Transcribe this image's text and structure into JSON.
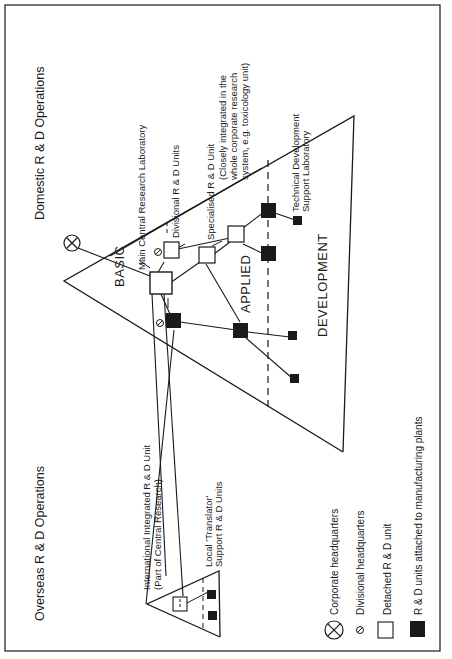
{
  "diagram": {
    "titles": {
      "domestic": "Domestic R & D Operations",
      "overseas": "Overseas R & D Operations"
    },
    "zones": {
      "basic": "BASIC",
      "applied": "APPLIED",
      "development": "DEVELOPMENT"
    },
    "annotations": {
      "main_central": "Main Central Research Laboratory",
      "divisional_units": "Divisional R & D Units",
      "specialised_line1": "Specialised R & D Unit",
      "specialised_line2": "(Closely integrated in the",
      "specialised_line3": "whole corporate research",
      "specialised_line4": "system, e.g. toxicology unit)",
      "tech_dev_line1": "Technical Development",
      "tech_dev_line2": "Support Laboratory",
      "international_line1": "International Integrated R & D Unit",
      "international_line2": "(Part of Central Research)",
      "translator_line1": "Local 'Translator'",
      "translator_line2": "Support R & D Units"
    },
    "legend": [
      {
        "icon": "corporate-hq-icon",
        "label": "Corporate headquarters"
      },
      {
        "icon": "divisional-hq-icon",
        "label": "Divisional headquarters"
      },
      {
        "icon": "detached-unit-icon",
        "label": "Detached R & D unit"
      },
      {
        "icon": "plant-unit-icon",
        "label": "R & D units attached to manufacturing plants"
      }
    ],
    "colors": {
      "ink": "#1a1a1a",
      "background": "#ffffff"
    },
    "orientation": "rotated 90° counter-clockwise"
  }
}
